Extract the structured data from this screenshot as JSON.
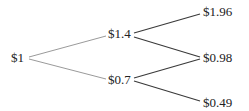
{
  "diagram": {
    "type": "binomial-tree",
    "root": {
      "label": "$1"
    },
    "step1": [
      {
        "label": "$1.4"
      },
      {
        "label": "$0.7"
      }
    ],
    "step2": [
      {
        "label": "$1.96"
      },
      {
        "label": "$0.98"
      },
      {
        "label": "$0.49"
      }
    ],
    "colors": {
      "edge_step1": "#9a9a9a",
      "edge_step2": "#3a3a3a",
      "text": "#222222"
    }
  }
}
